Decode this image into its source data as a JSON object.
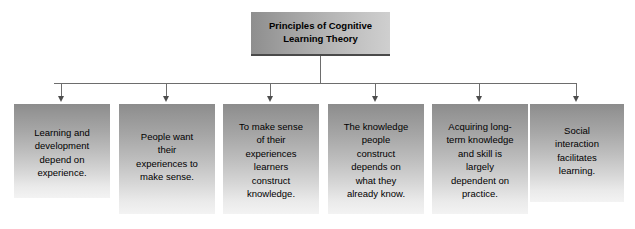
{
  "diagram": {
    "type": "hierarchy-tree",
    "title_box": {
      "label": "Principles of Cognitive Learning Theory",
      "line1": "Principles of Cognitive",
      "line2": "Learning Theory"
    },
    "connector": {
      "style": "orthogonal-bus-with-arrowheads",
      "color": "#6d6d6d",
      "arrow_color": "#4d4d4d"
    },
    "colors": {
      "box_gradient_top": "#8c8c8c",
      "box_gradient_bottom": "#f3f3f3",
      "title_gradient_left": "#8e8e8e",
      "title_gradient_right": "#cfcfcf",
      "title_underline": "#4a4a4a",
      "text": "#000000",
      "background": "#ffffff"
    },
    "nodes": [
      {
        "id": "node-1",
        "label": "Learning and development depend on experience.",
        "lines": [
          "Learning and",
          "development",
          "depend on",
          "experience."
        ],
        "x": 14,
        "width": 96,
        "height": 94,
        "text_top": 22
      },
      {
        "id": "node-2",
        "label": "People want their experiences to make sense.",
        "lines": [
          "People want",
          "their",
          "experiences to",
          "make sense."
        ],
        "x": 119,
        "width": 96,
        "height": 110,
        "text_top": 26
      },
      {
        "id": "node-3",
        "label": "To make sense of their experiences learners construct knowledge.",
        "lines": [
          "To make sense",
          "of their",
          "experiences",
          "learners",
          "construct",
          "knowledge."
        ],
        "x": 223,
        "width": 96,
        "height": 110,
        "text_top": 16
      },
      {
        "id": "node-4",
        "label": "The knowledge people construct depends on what they already know.",
        "lines": [
          "The knowledge",
          "people",
          "construct",
          "depends on",
          "what they",
          "already know."
        ],
        "x": 328,
        "width": 96,
        "height": 110,
        "text_top": 16
      },
      {
        "id": "node-5",
        "label": "Acquiring long-term knowledge and skill is largely dependent on practice.",
        "lines": [
          "Acquiring long-",
          "term knowledge",
          "and skill is",
          "largely",
          "dependent on",
          "practice."
        ],
        "x": 432,
        "width": 96,
        "height": 110,
        "text_top": 16
      },
      {
        "id": "node-6",
        "label": "Social interaction facilitates learning.",
        "lines": [
          "Social",
          "interaction",
          "facilitates",
          "learning."
        ],
        "x": 530,
        "width": 94,
        "height": 98,
        "text_top": 20
      }
    ]
  }
}
